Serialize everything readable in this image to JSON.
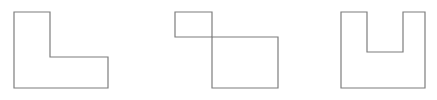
{
  "figure": {
    "background_color": "#ffffff",
    "stroke_color": "#7d7d7d",
    "stroke_width": 1.2,
    "width": 437,
    "height": 100
  },
  "shapes": [
    {
      "id": "shape-1",
      "name": "l-shape",
      "label": "L-shape",
      "description": "L shaped hexagon, tall vertical arm on the left with a horizontal foot extending right along the bottom",
      "vertex_count": 6,
      "points": "14,12 50,12 50,57 108,57 108,88 14,88",
      "bbox": {
        "x": 14,
        "y": 12,
        "width": 94,
        "height": 76
      }
    },
    {
      "id": "shape-2",
      "name": "two-overlapping-rectangles",
      "label": "Two corner-joined rectangles",
      "description": "A small rectangle at the upper left and a larger rectangle at the lower right meeting at a shared corner point",
      "sub_shapes": [
        {
          "id": "shape-2a",
          "name": "small-rectangle",
          "label": "Small rectangle",
          "points": "175,12 212,12 212,37 175,37",
          "bbox": {
            "x": 175,
            "y": 12,
            "width": 37,
            "height": 25
          }
        },
        {
          "id": "shape-2b",
          "name": "large-rectangle",
          "label": "Large rectangle",
          "points": "212,37 278,37 278,88 212,88",
          "bbox": {
            "x": 212,
            "y": 37,
            "width": 66,
            "height": 51
          }
        }
      ],
      "bbox": {
        "x": 175,
        "y": 12,
        "width": 103,
        "height": 76
      }
    },
    {
      "id": "shape-3",
      "name": "u-shape",
      "label": "U-shape",
      "description": "U shaped octagon with a rectangular notch cut down from the top center",
      "vertex_count": 8,
      "points": "341,12 367,12 367,52 403,52 403,12 425,12 425,88 341,88",
      "bbox": {
        "x": 341,
        "y": 12,
        "width": 84,
        "height": 76
      }
    }
  ]
}
